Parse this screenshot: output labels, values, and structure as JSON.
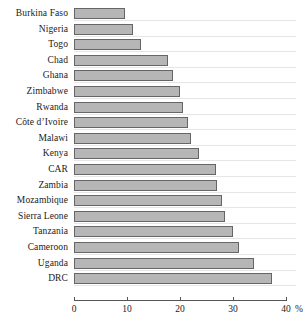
{
  "chart_data": {
    "type": "bar",
    "orientation": "horizontal",
    "title": "",
    "xlabel": "%",
    "ylabel": "",
    "xlim": [
      0,
      40
    ],
    "xticks": [
      0,
      10,
      20,
      30,
      40
    ],
    "xtick_labels": [
      "0",
      "10",
      "20",
      "30",
      "40"
    ],
    "x_unit_suffix": "%",
    "grid": true,
    "legend": "none",
    "categories": [
      "Burkina Faso",
      "Nigeria",
      "Togo",
      "Chad",
      "Ghana",
      "Zimbabwe",
      "Rwanda",
      "Côte d’Ivoire",
      "Malawi",
      "Kenya",
      "CAR",
      "Zambia",
      "Mozambique",
      "Sierra Leone",
      "Tanzania",
      "Cameroon",
      "Uganda",
      "DRC"
    ],
    "values": [
      9.6,
      11.2,
      12.7,
      17.8,
      18.6,
      20.0,
      20.6,
      21.5,
      22.1,
      23.5,
      26.7,
      26.9,
      28.0,
      28.4,
      30.0,
      31.2,
      33.9,
      37.4
    ],
    "bar_fill_color": "#b6b6b6",
    "bar_edge_color": "#666666",
    "axis_color": "#555555",
    "grid_color": "#e6e6e6"
  },
  "axis": {
    "percent_suffix": "%"
  }
}
